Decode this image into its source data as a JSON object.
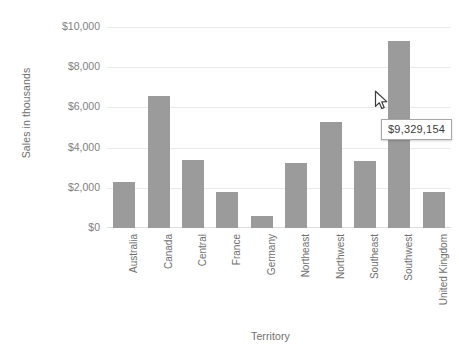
{
  "chart_data": {
    "type": "bar",
    "title": "",
    "xlabel": "Territory",
    "ylabel": "Sales in thousands",
    "categories": [
      "Australia",
      "Canada",
      "Central",
      "France",
      "Germany",
      "Northeast",
      "Northwest",
      "Southeast",
      "Southwest",
      "United Kingdom"
    ],
    "values": [
      2300,
      6580,
      3360,
      1790,
      580,
      3250,
      5290,
      3350,
      9329,
      1790
    ],
    "ylim": [
      0,
      10000
    ],
    "ytick_values": [
      10000,
      8000,
      6000,
      4000,
      2000,
      0
    ],
    "ytick_labels": [
      "$10,000",
      "$8,000",
      "$6,000",
      "$4,000",
      "$2,000",
      "$0"
    ],
    "grid": true,
    "legend": false,
    "bar_color": "#9b9b9b",
    "gridline_color": "#e9e9e9",
    "text_color": "#6e6e6e"
  },
  "tooltip": {
    "value": "$9,329,154",
    "target_category": "Southwest",
    "background": "#ffffff",
    "border_color": "#a8a8a8"
  },
  "cursor": {
    "icon": "arrow-pointer-icon"
  }
}
